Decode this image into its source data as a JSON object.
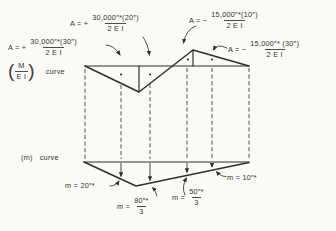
{
  "colors": {
    "background": "#fbfaf7",
    "ink": "#2f2f2f"
  },
  "mei_section": {
    "paren_open": "(",
    "paren_close": ")",
    "ratio_numerator": "M",
    "ratio_denominator": "E I",
    "curve_word": "curve",
    "area_labels": [
      {
        "prefix": "A = +",
        "numerator": "30,000″*(20″)",
        "denominator": "2 E I"
      },
      {
        "prefix": "A = +",
        "numerator": "30,000″*(30″)",
        "denominator": "2 E I"
      },
      {
        "prefix": "A = −",
        "numerator": "15,000″*(10″)",
        "denominator": "2 E I"
      },
      {
        "prefix": "A = −",
        "numerator": "15,000″* (30″)",
        "denominator": "2 E I"
      }
    ]
  },
  "m_section": {
    "curve_label_paren": "(m)",
    "curve_word": "curve",
    "value_labels": [
      {
        "text": "m = 20″*"
      },
      {
        "prefix": "m =",
        "numerator": "80″*",
        "denominator": "3"
      },
      {
        "prefix": "m =",
        "numerator": "50″*",
        "denominator": "3"
      },
      {
        "text": "m = 10″*"
      }
    ]
  }
}
